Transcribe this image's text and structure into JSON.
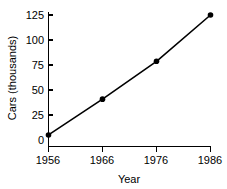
{
  "chart_data": {
    "type": "line",
    "title": "",
    "xlabel": "Year",
    "ylabel": "Cars (thousands)",
    "x": [
      1956,
      1966,
      1976,
      1986
    ],
    "categories": [
      "1956",
      "1966",
      "1976",
      "1986"
    ],
    "values": [
      11,
      45,
      81,
      125
    ],
    "series": [
      {
        "name": "Cars (thousands)",
        "values": [
          11,
          45,
          81,
          125
        ]
      }
    ],
    "xlim": [
      1956,
      1986
    ],
    "ylim": [
      0,
      125
    ],
    "xticks": [
      1956,
      1966,
      1976,
      1986
    ],
    "xtick_labels": [
      "1956",
      "1966",
      "1976",
      "1986"
    ],
    "yticks": [
      0,
      25,
      50,
      75,
      100,
      125
    ],
    "ytick_labels": [
      "0",
      "25",
      "50",
      "75",
      "100",
      "125"
    ],
    "grid": false,
    "legend": false,
    "legend_position": "none",
    "marker": "filled-circle",
    "line_color": "#000000",
    "marker_color": "#000000",
    "background_color": "#ffffff"
  }
}
